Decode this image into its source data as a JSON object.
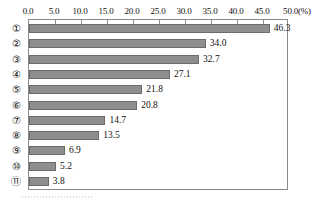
{
  "chart_data": {
    "type": "bar",
    "orientation": "horizontal",
    "title": "",
    "xlabel": "(%)",
    "ylabel": "",
    "xlim": [
      0,
      50
    ],
    "xticks": [
      "0.0",
      "5.0",
      "10.0",
      "15.0",
      "20.0",
      "25.0",
      "30.0",
      "35.0",
      "40.0",
      "45.0",
      "50.0"
    ],
    "xtick_values": [
      0,
      5,
      10,
      15,
      20,
      25,
      30,
      35,
      40,
      45,
      50
    ],
    "unit_label": "(%)",
    "grid": false,
    "legend": "none",
    "categories": [
      "①",
      "②",
      "③",
      "④",
      "⑤",
      "⑥",
      "⑦",
      "⑧",
      "⑨",
      "⑩",
      "⑪"
    ],
    "values": [
      46.3,
      34.0,
      32.7,
      27.1,
      21.8,
      20.8,
      14.7,
      13.5,
      6.9,
      5.2,
      3.8
    ],
    "value_labels": [
      "46.3",
      "34.0",
      "32.7",
      "27.1",
      "21.8",
      "20.8",
      "14.7",
      "13.5",
      "6.9",
      "5.2",
      "3.8"
    ],
    "bar_color": "#8e8e8e",
    "bar_border_color": "#6b6b6b",
    "frame_color": "#8a8a8a",
    "text_color": "#111111"
  }
}
